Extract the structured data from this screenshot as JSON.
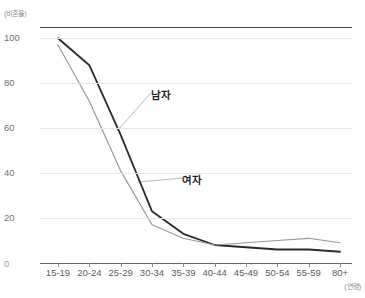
{
  "chart_data": {
    "type": "line",
    "title": "",
    "subtitle": "",
    "ylabel": "(비혼율)",
    "xlabel": "(연령)",
    "categories": [
      "15-19",
      "20-24",
      "25-29",
      "30-34",
      "35-39",
      "40-44",
      "45-49",
      "50-54",
      "55-59",
      "80+"
    ],
    "x_origin_label": "0",
    "yticks": [
      "100",
      "80",
      "60",
      "40",
      "20"
    ],
    "ylim": [
      0,
      105
    ],
    "xlim": [
      0,
      9
    ],
    "grid": true,
    "legend_position": "inline-annotation",
    "series": [
      {
        "name": "남자",
        "color": "#2b2b2b",
        "values": [
          100,
          88,
          57,
          23,
          13,
          8,
          7,
          6,
          6,
          5
        ]
      },
      {
        "name": "여자",
        "color": "#999999",
        "values": [
          97,
          72,
          41,
          17,
          11,
          8,
          9,
          10,
          11,
          9
        ]
      }
    ],
    "annotations": [
      {
        "text": "남자",
        "series": "남자",
        "x_frac": 0.355,
        "y_frac": 0.255
      },
      {
        "text": "여자",
        "series": "여자",
        "x_frac": 0.455,
        "y_frac": 0.615
      }
    ]
  },
  "axis": {
    "y_unit": "(비혼율)",
    "x_unit": "(연령)",
    "zero_label": "0"
  }
}
